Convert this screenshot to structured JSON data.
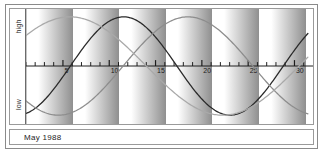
{
  "caption": "May 1988",
  "axis_labels": {
    "top": "high",
    "bottom": "low"
  },
  "colors": {
    "physical": "#2a2a2a",
    "emotional": "#8d8d8d",
    "intellectual": "#a9a9a9",
    "frame": "#8a8a8a",
    "axis": "#1c1c1c",
    "band_light": "#ffffff",
    "band_dark": "#8f8f8f",
    "background": "#ffffff"
  },
  "chart_data": {
    "type": "line",
    "title": "May 1988",
    "xlabel": "",
    "ylabel": "",
    "ylim": [
      -1,
      1
    ],
    "xlim": [
      1,
      31
    ],
    "grid": false,
    "legend": "none",
    "axis_value_labels": {
      "high": "high",
      "low": "low",
      "zero": ""
    },
    "x_tick_labels": [
      "5",
      "10",
      "15",
      "20",
      "25",
      "30"
    ],
    "x_tick_values": [
      5,
      10,
      15,
      20,
      25,
      30
    ],
    "x_minor_tick_values": [
      1,
      2,
      3,
      4,
      5,
      6,
      7,
      8,
      9,
      10,
      11,
      12,
      13,
      14,
      15,
      16,
      17,
      18,
      19,
      20,
      21,
      22,
      23,
      24,
      25,
      26,
      27,
      28,
      29,
      30,
      31
    ],
    "shaded_bands": [
      {
        "start": 1.0,
        "end": 6.0
      },
      {
        "start": 6.0,
        "end": 11.0
      },
      {
        "start": 11.0,
        "end": 16.0
      },
      {
        "start": 16.0,
        "end": 21.0
      },
      {
        "start": 21.0,
        "end": 26.0
      },
      {
        "start": 26.0,
        "end": 31.0
      }
    ],
    "series": [
      {
        "name": "physical",
        "color": "#2a2a2a",
        "period_days": 23,
        "phase_offset_days": 5.8,
        "amplitude": 1.0
      },
      {
        "name": "emotional",
        "color": "#8d8d8d",
        "period_days": 28,
        "phase_offset_days": 11.5,
        "amplitude": 1.0
      },
      {
        "name": "intellectual",
        "color": "#a9a9a9",
        "period_days": 33,
        "phase_offset_days": -2.5,
        "amplitude": 1.0
      }
    ]
  }
}
